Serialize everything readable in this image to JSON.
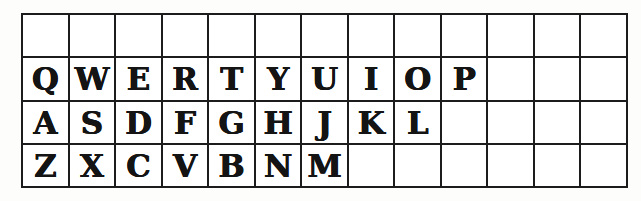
{
  "grid": {
    "columns": 13,
    "row_count": 4,
    "line_color": "#1c1c1c",
    "cell_background": "#ffffff",
    "letter_color": "#141414",
    "letter_style": "ornate-illuminated-capitals",
    "rows": [
      {
        "name": "blank-row",
        "cells": [
          "",
          "",
          "",
          "",
          "",
          "",
          "",
          "",
          "",
          "",
          "",
          "",
          ""
        ]
      },
      {
        "name": "top-letter-row",
        "cells": [
          "Q",
          "W",
          "E",
          "R",
          "T",
          "Y",
          "U",
          "I",
          "O",
          "P",
          "",
          "",
          ""
        ]
      },
      {
        "name": "home-letter-row",
        "cells": [
          "A",
          "S",
          "D",
          "F",
          "G",
          "H",
          "J",
          "K",
          "L",
          "",
          "",
          "",
          ""
        ]
      },
      {
        "name": "bottom-letter-row",
        "cells": [
          "Z",
          "X",
          "C",
          "V",
          "B",
          "N",
          "M",
          "",
          "",
          "",
          "",
          "",
          ""
        ]
      }
    ]
  }
}
